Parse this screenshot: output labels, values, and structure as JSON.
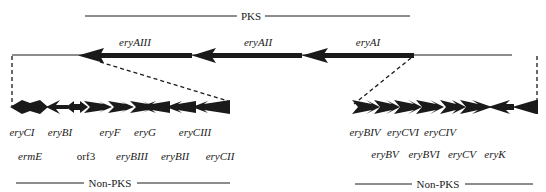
{
  "diagram": {
    "title_pks": "PKS",
    "title_nonpks_left": "Non-PKS",
    "title_nonpks_right": "Non-PKS",
    "pks_genes": [
      {
        "name": "eryAIII",
        "x": 135
      },
      {
        "name": "eryAII",
        "x": 258
      },
      {
        "name": "eryAI",
        "x": 368
      }
    ],
    "left_cluster": {
      "row1": [
        {
          "name": "eryCI",
          "x": 22
        },
        {
          "name": "eryBI",
          "x": 60
        },
        {
          "name": "eryF",
          "x": 110
        },
        {
          "name": "eryG",
          "x": 145
        },
        {
          "name": "eryCIII",
          "x": 195
        }
      ],
      "row2": [
        {
          "name": "ermE",
          "x": 30,
          "italic": true
        },
        {
          "name": "orf3",
          "x": 86,
          "italic": false
        },
        {
          "name": "eryBIII",
          "x": 132,
          "italic": true
        },
        {
          "name": "eryBII",
          "x": 175,
          "italic": true
        },
        {
          "name": "eryCII",
          "x": 220,
          "italic": true
        }
      ]
    },
    "right_cluster": {
      "row1": [
        {
          "name": "eryBIV",
          "x": 365
        },
        {
          "name": "eryCVI",
          "x": 403
        },
        {
          "name": "eryCIV",
          "x": 440
        }
      ],
      "row2": [
        {
          "name": "eryBV",
          "x": 385
        },
        {
          "name": "eryBVI",
          "x": 424
        },
        {
          "name": "eryCV",
          "x": 462
        },
        {
          "name": "eryK",
          "x": 495
        }
      ]
    },
    "colors": {
      "ink": "#1a1a1a",
      "background": "#ffffff"
    }
  }
}
